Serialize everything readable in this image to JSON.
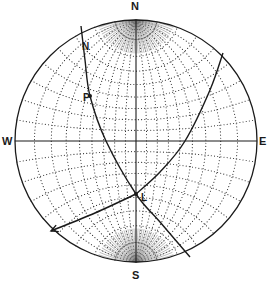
{
  "diagram": {
    "type": "stereonet",
    "projection": "Wulff equal-angle net",
    "center": [
      136,
      141
    ],
    "radius": 121,
    "grid_interval_deg": 10,
    "colors": {
      "ink": "#1a1a1a",
      "grid": "#333333",
      "paper": "#ffffff"
    }
  },
  "labels": {
    "north": "N",
    "south": "S",
    "west": "W",
    "east": "E"
  },
  "annotations": [
    {
      "id": "plane-N",
      "text": "N",
      "x": 82,
      "y": 50
    },
    {
      "id": "point-P",
      "text": "P",
      "x": 83,
      "y": 101,
      "dot": [
        90,
        96
      ]
    },
    {
      "id": "point-L",
      "text": "L",
      "x": 141,
      "y": 201,
      "dot": [
        136,
        194
      ]
    }
  ],
  "great_circles": [
    {
      "id": "plane-1",
      "points": [
        [
          81,
          26
        ],
        [
          85,
          60
        ],
        [
          90,
          96
        ],
        [
          106,
          141
        ],
        [
          136,
          194
        ],
        [
          160,
          222
        ],
        [
          190,
          257
        ]
      ]
    },
    {
      "id": "plane-2",
      "points": [
        [
          223,
          53
        ],
        [
          210,
          90
        ],
        [
          185,
          141
        ],
        [
          160,
          172
        ],
        [
          136,
          194
        ]
      ]
    }
  ],
  "arrow": {
    "id": "trend-arrow",
    "points": [
      [
        136,
        194
      ],
      [
        95,
        213
      ],
      [
        51,
        231
      ]
    ]
  }
}
